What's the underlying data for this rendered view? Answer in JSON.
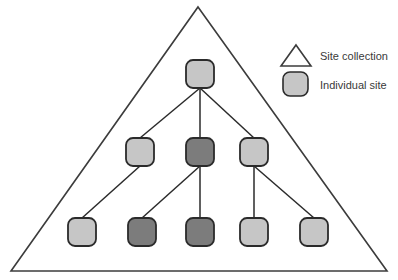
{
  "diagram": {
    "background_color": "#ffffff",
    "outline_color": "#3c3c3c",
    "edge_color": "#2b2b2b",
    "colors": {
      "light_node_fill": "#c6c6c6",
      "dark_node_fill": "#7c7c7c",
      "node_stroke": "#2b2b2b",
      "text": "#3a3a3a"
    },
    "site_collection_shape": {
      "name": "site-collection-triangle",
      "apex_x": 198,
      "apex_y": 7,
      "left_x": 11,
      "right_x": 387,
      "base_y": 271
    },
    "nodes": [
      {
        "id": "root",
        "label": "",
        "x": 200,
        "y": 74,
        "size": 28,
        "shade": "light",
        "level": 0
      },
      {
        "id": "mid-1",
        "label": "",
        "x": 140,
        "y": 152,
        "size": 28,
        "shade": "light",
        "level": 1
      },
      {
        "id": "mid-2",
        "label": "",
        "x": 200,
        "y": 152,
        "size": 28,
        "shade": "dark",
        "level": 1
      },
      {
        "id": "mid-3",
        "label": "",
        "x": 254,
        "y": 152,
        "size": 28,
        "shade": "light",
        "level": 1
      },
      {
        "id": "leaf-1",
        "label": "",
        "x": 82,
        "y": 232,
        "size": 28,
        "shade": "light",
        "level": 2
      },
      {
        "id": "leaf-2",
        "label": "",
        "x": 142,
        "y": 232,
        "size": 28,
        "shade": "dark",
        "level": 2
      },
      {
        "id": "leaf-3",
        "label": "",
        "x": 200,
        "y": 232,
        "size": 28,
        "shade": "dark",
        "level": 2
      },
      {
        "id": "leaf-4",
        "label": "",
        "x": 254,
        "y": 232,
        "size": 28,
        "shade": "light",
        "level": 2
      },
      {
        "id": "leaf-5",
        "label": "",
        "x": 314,
        "y": 232,
        "size": 28,
        "shade": "light",
        "level": 2
      }
    ],
    "edges": [
      {
        "from": "root",
        "to": "mid-1"
      },
      {
        "from": "root",
        "to": "mid-2"
      },
      {
        "from": "root",
        "to": "mid-3"
      },
      {
        "from": "mid-1",
        "to": "leaf-1"
      },
      {
        "from": "mid-2",
        "to": "leaf-2"
      },
      {
        "from": "mid-2",
        "to": "leaf-3"
      },
      {
        "from": "mid-3",
        "to": "leaf-4"
      },
      {
        "from": "mid-3",
        "to": "leaf-5"
      }
    ]
  },
  "legend": {
    "items": [
      {
        "icon": "triangle-icon",
        "label": "Site collection",
        "icon_x": 281,
        "icon_y": 45,
        "icon_w": 30,
        "icon_h": 21,
        "text_x": 320,
        "text_y": 60
      },
      {
        "icon": "rounded-square-icon",
        "label": "Individual site",
        "icon_x": 283,
        "icon_y": 72,
        "icon_w": 25,
        "icon_h": 24,
        "text_x": 320,
        "text_y": 89
      }
    ]
  }
}
